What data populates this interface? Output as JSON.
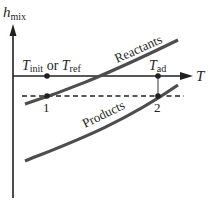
{
  "diagram": {
    "y_axis": {
      "label": "h",
      "label_subscript": "mix"
    },
    "x_axis": {
      "label": "T"
    },
    "curves": [
      {
        "name": "Reactants",
        "label": "Reactants"
      },
      {
        "name": "Products",
        "label": "Products"
      }
    ],
    "temperature_labels": {
      "initial_main": "T",
      "initial_sub": "init",
      "or_text": " or ",
      "ref_main": "T",
      "ref_sub": "ref",
      "adiabatic_main": "T",
      "adiabatic_sub": "ad"
    },
    "states": [
      {
        "label": "1"
      },
      {
        "label": "2"
      }
    ],
    "colors": {
      "axis": "#231f20",
      "curve": "#4d4d4f",
      "background": "#ffffff"
    }
  }
}
